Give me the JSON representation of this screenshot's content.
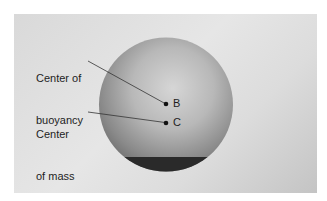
{
  "diagram": {
    "type": "physics-illustration",
    "labels": {
      "buoyancy_line1": "Center of",
      "buoyancy_line2": "buoyancy",
      "mass_line1": "Center",
      "mass_line2": "of mass"
    },
    "points": [
      {
        "id": "B",
        "letter": "B",
        "meaning": "Center of buoyancy"
      },
      {
        "id": "C",
        "letter": "C",
        "meaning": "Center of mass"
      }
    ],
    "colors": {
      "background": "#ffffff",
      "panel": "#dedede",
      "sphere_light": "#d0d0d0",
      "sphere_dark": "#6e6e6e",
      "ballast_band": "#2a2a2a",
      "text": "#1e1e1e"
    }
  }
}
